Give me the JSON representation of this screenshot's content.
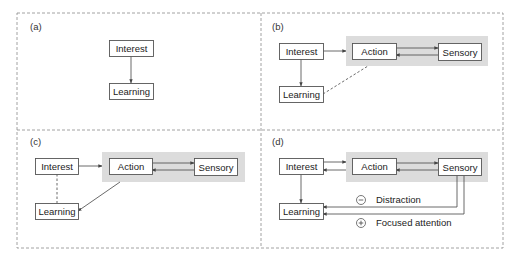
{
  "figure": {
    "frame": {
      "x": 17,
      "y": 13,
      "w": 486,
      "h": 235,
      "divider_x": 261,
      "divider_y": 130,
      "color": "#8a8a8a"
    },
    "colors": {
      "node_border": "#555555",
      "node_fill": "#ffffff",
      "group_fill": "#dcdcdc",
      "line": "#444444",
      "text": "#222222"
    },
    "panels": [
      {
        "id": "a",
        "label": "(a)",
        "label_pos": [
          30,
          30
        ],
        "group": null,
        "nodes": [
          {
            "id": "interest",
            "label": "Interest",
            "x": 109,
            "y": 40,
            "w": 44,
            "h": 16
          },
          {
            "id": "learning",
            "label": "Learning",
            "x": 109,
            "y": 83,
            "w": 44,
            "h": 16
          }
        ]
      },
      {
        "id": "b",
        "label": "(b)",
        "label_pos": [
          272,
          30
        ],
        "group": {
          "x": 346,
          "y": 36,
          "w": 142,
          "h": 30
        },
        "nodes": [
          {
            "id": "interest",
            "label": "Interest",
            "x": 279,
            "y": 43,
            "w": 44,
            "h": 16
          },
          {
            "id": "learning",
            "label": "Learning",
            "x": 279,
            "y": 86,
            "w": 44,
            "h": 16
          },
          {
            "id": "action",
            "label": "Action",
            "x": 352,
            "y": 43,
            "w": 44,
            "h": 16
          },
          {
            "id": "sensory",
            "label": "Sensory",
            "x": 438,
            "y": 43,
            "w": 43,
            "h": 17
          }
        ]
      },
      {
        "id": "c",
        "label": "(c)",
        "label_pos": [
          30,
          145
        ],
        "group": {
          "x": 102,
          "y": 152,
          "w": 143,
          "h": 30
        },
        "nodes": [
          {
            "id": "interest",
            "label": "Interest",
            "x": 35,
            "y": 158,
            "w": 43,
            "h": 16
          },
          {
            "id": "learning",
            "label": "Learning",
            "x": 35,
            "y": 203,
            "w": 43,
            "h": 16
          },
          {
            "id": "action",
            "label": "Action",
            "x": 109,
            "y": 158,
            "w": 43,
            "h": 16
          },
          {
            "id": "sensory",
            "label": "Sensory",
            "x": 194,
            "y": 158,
            "w": 43,
            "h": 17
          }
        ]
      },
      {
        "id": "d",
        "label": "(d)",
        "label_pos": [
          272,
          145
        ],
        "group": {
          "x": 346,
          "y": 152,
          "w": 142,
          "h": 30
        },
        "nodes": [
          {
            "id": "interest",
            "label": "Interest",
            "x": 279,
            "y": 158,
            "w": 44,
            "h": 16
          },
          {
            "id": "learning",
            "label": "Learning",
            "x": 279,
            "y": 203,
            "w": 44,
            "h": 16
          },
          {
            "id": "action",
            "label": "Action",
            "x": 352,
            "y": 158,
            "w": 44,
            "h": 16
          },
          {
            "id": "sensory",
            "label": "Sensory",
            "x": 438,
            "y": 158,
            "w": 43,
            "h": 17
          }
        ],
        "legend": [
          {
            "symbol": "−",
            "symbol_name": "minus-circle-icon",
            "label": "Distraction",
            "cx": 361,
            "cy": 200,
            "tx": 376,
            "ty": 203
          },
          {
            "symbol": "+",
            "symbol_name": "plus-circle-icon",
            "label": "Focused attention",
            "cx": 361,
            "cy": 223,
            "tx": 376,
            "ty": 226
          }
        ]
      }
    ],
    "edges": [
      {
        "panel": "a",
        "from": "Interest",
        "to": "Learning",
        "style": "solid",
        "points": [
          [
            131,
            56
          ],
          [
            131,
            83
          ]
        ]
      },
      {
        "panel": "b",
        "from": "Interest",
        "to": "Learning",
        "style": "solid",
        "points": [
          [
            301,
            59
          ],
          [
            301,
            86
          ]
        ]
      },
      {
        "panel": "b",
        "from": "Interest",
        "to": "Action",
        "style": "solid",
        "points": [
          [
            323,
            51
          ],
          [
            346,
            51
          ]
        ]
      },
      {
        "panel": "b",
        "from": "Action",
        "to": "Sensory",
        "style": "solid",
        "points": [
          [
            396,
            48
          ],
          [
            438,
            48
          ]
        ]
      },
      {
        "panel": "b",
        "from": "Sensory",
        "to": "Action",
        "style": "solid",
        "points": [
          [
            438,
            55
          ],
          [
            396,
            55
          ]
        ]
      },
      {
        "panel": "b",
        "from": "Learning",
        "to": "Action",
        "style": "dashed",
        "arrow": false,
        "points": [
          [
            323,
            94
          ],
          [
            368,
            66
          ]
        ]
      },
      {
        "panel": "c",
        "from": "Interest",
        "to": "Learning",
        "style": "dashed",
        "arrow": false,
        "points": [
          [
            57,
            174
          ],
          [
            57,
            203
          ]
        ]
      },
      {
        "panel": "c",
        "from": "Interest",
        "to": "Action",
        "style": "solid",
        "points": [
          [
            78,
            166
          ],
          [
            102,
            166
          ]
        ]
      },
      {
        "panel": "c",
        "from": "Action",
        "to": "Sensory",
        "style": "solid",
        "points": [
          [
            152,
            163
          ],
          [
            194,
            163
          ]
        ]
      },
      {
        "panel": "c",
        "from": "Sensory",
        "to": "Action",
        "style": "solid",
        "points": [
          [
            194,
            170
          ],
          [
            152,
            170
          ]
        ]
      },
      {
        "panel": "c",
        "from": "Action",
        "to": "Learning",
        "style": "solid",
        "points": [
          [
            120,
            182
          ],
          [
            78,
            211
          ]
        ]
      },
      {
        "panel": "d",
        "from": "Interest",
        "to": "Learning",
        "style": "solid",
        "points": [
          [
            301,
            174
          ],
          [
            301,
            203
          ]
        ]
      },
      {
        "panel": "d",
        "from": "Interest",
        "to": "Action",
        "style": "solid",
        "points": [
          [
            323,
            162
          ],
          [
            346,
            162
          ]
        ]
      },
      {
        "panel": "d",
        "from": "Action",
        "to": "Interest",
        "style": "solid",
        "points": [
          [
            346,
            170
          ],
          [
            323,
            170
          ]
        ]
      },
      {
        "panel": "d",
        "from": "Action",
        "to": "Sensory",
        "style": "solid",
        "points": [
          [
            396,
            163
          ],
          [
            438,
            163
          ]
        ]
      },
      {
        "panel": "d",
        "from": "Sensory",
        "to": "Action",
        "style": "solid",
        "points": [
          [
            438,
            170
          ],
          [
            396,
            170
          ]
        ]
      },
      {
        "panel": "d",
        "from": "Sensory",
        "to": "Learning",
        "label": "Distraction",
        "style": "solid",
        "points": [
          [
            457,
            175
          ],
          [
            457,
            207
          ],
          [
            323,
            207
          ]
        ]
      },
      {
        "panel": "d",
        "from": "Sensory",
        "to": "Learning",
        "label": "Focused attention",
        "style": "solid",
        "points": [
          [
            464,
            175
          ],
          [
            464,
            214
          ],
          [
            323,
            214
          ]
        ]
      }
    ]
  }
}
